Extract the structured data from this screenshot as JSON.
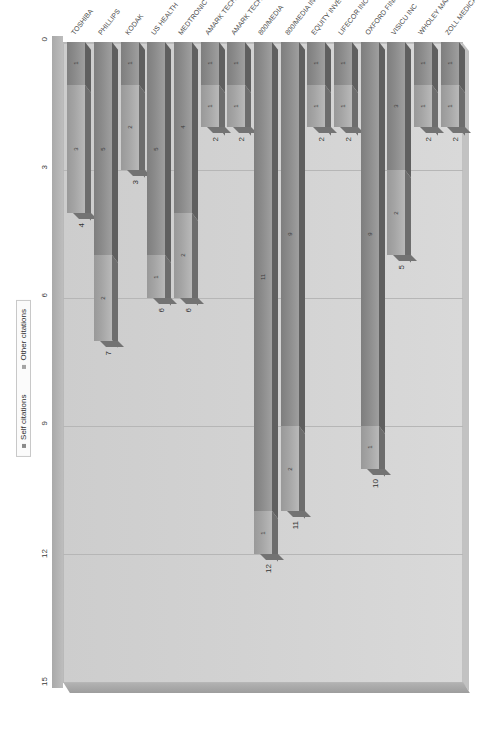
{
  "chart_data": {
    "type": "bar",
    "subtype": "stacked-horizontal-3d",
    "title": "",
    "xlabel": "",
    "ylabel": "",
    "xlim": [
      0,
      15
    ],
    "xticks": [
      "0",
      "3",
      "6",
      "9",
      "12",
      "15"
    ],
    "grid": true,
    "legend_position": "bottom",
    "categories": [
      "TOSHIBA",
      "PHILLIPS",
      "KODAK",
      "US HEALTH",
      "MEDTRONIC",
      "AMARK TECHNOLOGIES",
      "AMARK TECHNOLOGIES INC",
      "800/MEDIA",
      "800/MEDIA INC",
      "EQUITY INVESTORS",
      "LIFECOR INC",
      "OXFORD FINANCE",
      "VISICU INC",
      "WHOLEY MARK H",
      "ZOLL MEDICAL"
    ],
    "series": [
      {
        "name": "Self citations",
        "values": [
          1,
          5,
          1,
          5,
          4,
          1,
          1,
          11,
          9,
          1,
          1,
          9,
          3,
          1,
          1
        ]
      },
      {
        "name": "Other citations",
        "values": [
          3,
          2,
          2,
          1,
          2,
          1,
          1,
          1,
          2,
          1,
          1,
          1,
          2,
          1,
          1
        ]
      }
    ],
    "totals": [
      4,
      7,
      3,
      6,
      6,
      2,
      2,
      12,
      11,
      2,
      2,
      10,
      5,
      2,
      2
    ]
  },
  "legend": {
    "items": [
      {
        "label": "Self citations",
        "color": "#8a8a8a"
      },
      {
        "label": "Other citations",
        "color": "#a4a4a4"
      }
    ]
  }
}
